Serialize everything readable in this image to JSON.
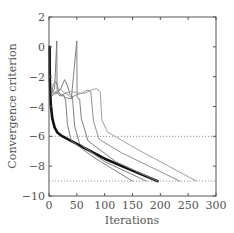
{
  "chart_data": {
    "type": "line",
    "title": "",
    "xlabel": "Iterations",
    "ylabel": "Convergence criterion",
    "xlim": [
      0,
      300
    ],
    "ylim": [
      -10,
      2
    ],
    "xticks": [
      0,
      50,
      100,
      150,
      200,
      250,
      300
    ],
    "yticks": [
      2,
      0,
      -2,
      -4,
      -6,
      -8,
      -10
    ],
    "xtick_labels": [
      "0",
      "50",
      "100",
      "150",
      "200",
      "250",
      "300"
    ],
    "ytick_labels": [
      "2",
      "0",
      "−2",
      "−4",
      "−6",
      "−8",
      "−10"
    ],
    "grid": false,
    "legend": null,
    "reference_lines": [
      {
        "y": -6,
        "style": "dotted",
        "color": "#999999"
      },
      {
        "y": -9,
        "style": "dotted",
        "color": "#999999"
      }
    ],
    "series": [
      {
        "name": "thick-black",
        "color": "#111111",
        "width": 2.6,
        "points": [
          [
            1,
            0
          ],
          [
            1.5,
            -2
          ],
          [
            3,
            -3.8
          ],
          [
            6,
            -4.8
          ],
          [
            10,
            -5.4
          ],
          [
            15,
            -5.75
          ],
          [
            22,
            -5.95
          ],
          [
            60,
            -6.7
          ],
          [
            100,
            -7.5
          ],
          [
            150,
            -8.3
          ],
          [
            195,
            -9.0
          ]
        ]
      },
      {
        "name": "grey-1",
        "color": "#808080",
        "width": 1,
        "points": [
          [
            5,
            -3.0
          ],
          [
            8,
            -2.5
          ],
          [
            12,
            -2.3
          ],
          [
            15,
            -2.6
          ],
          [
            18,
            -3.1
          ],
          [
            22,
            -3.3
          ],
          [
            26,
            -3.2
          ],
          [
            30,
            -3.6
          ],
          [
            33,
            -5.2
          ],
          [
            40,
            -6.3
          ],
          [
            80,
            -7.4
          ],
          [
            150,
            -9.0
          ]
        ]
      },
      {
        "name": "grey-2",
        "color": "#808080",
        "width": 1,
        "points": [
          [
            5,
            -3.1
          ],
          [
            10,
            -2.8
          ],
          [
            14,
            0.4
          ],
          [
            14.5,
            -3.0
          ],
          [
            20,
            -2.9
          ],
          [
            28,
            -2.2
          ],
          [
            32,
            -2.5
          ],
          [
            38,
            -3.2
          ],
          [
            42,
            -3.3
          ],
          [
            46,
            -5.3
          ],
          [
            55,
            -6.5
          ],
          [
            100,
            -7.7
          ],
          [
            175,
            -9.0
          ]
        ]
      },
      {
        "name": "grey-3",
        "color": "#808080",
        "width": 1,
        "points": [
          [
            5,
            -3.3
          ],
          [
            10,
            -3.1
          ],
          [
            16,
            -3.0
          ],
          [
            22,
            -3.2
          ],
          [
            30,
            -3.4
          ],
          [
            40,
            -3.5
          ],
          [
            50,
            0.4
          ],
          [
            50.5,
            -3.4
          ],
          [
            55,
            -3.5
          ],
          [
            58,
            -4.8
          ],
          [
            70,
            -6.3
          ],
          [
            120,
            -7.7
          ],
          [
            195,
            -9.0
          ]
        ]
      },
      {
        "name": "grey-4",
        "color": "#909090",
        "width": 1,
        "points": [
          [
            5,
            -3.2
          ],
          [
            12,
            -3.0
          ],
          [
            20,
            -3.3
          ],
          [
            30,
            -3.1
          ],
          [
            40,
            -3.4
          ],
          [
            50,
            -3.2
          ],
          [
            60,
            -3.1
          ],
          [
            68,
            -2.9
          ],
          [
            75,
            -3.0
          ],
          [
            80,
            -5.0
          ],
          [
            90,
            -6.2
          ],
          [
            130,
            -7.1
          ],
          [
            235,
            -9.0
          ]
        ]
      },
      {
        "name": "grey-5",
        "color": "#a0a0a0",
        "width": 1,
        "points": [
          [
            6,
            -2.9
          ],
          [
            12,
            -3.2
          ],
          [
            20,
            -2.8
          ],
          [
            28,
            -3.1
          ],
          [
            40,
            -3.0
          ],
          [
            55,
            -3.1
          ],
          [
            65,
            -3.1
          ],
          [
            75,
            -2.9
          ],
          [
            85,
            -2.8
          ],
          [
            92,
            -3.0
          ],
          [
            95,
            -4.9
          ],
          [
            105,
            -5.7
          ],
          [
            160,
            -6.9
          ],
          [
            265,
            -9.0
          ]
        ]
      }
    ]
  },
  "axes": {
    "xlabel": "Iterations",
    "ylabel": "Convergence criterion"
  }
}
